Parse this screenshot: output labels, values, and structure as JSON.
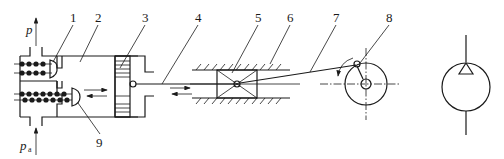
{
  "diagram": {
    "type": "hydraulic-schematic",
    "part_labels": [
      "1",
      "2",
      "3",
      "4",
      "5",
      "6",
      "7",
      "8",
      "9"
    ],
    "pressure_labels": {
      "outlet": "p",
      "inlet": "p",
      "inlet_subscript": "a"
    },
    "components": [
      {
        "id": "1",
        "name": "discharge check valve"
      },
      {
        "id": "2",
        "name": "sealed working chamber"
      },
      {
        "id": "3",
        "name": "plunger"
      },
      {
        "id": "4",
        "name": "piston rod"
      },
      {
        "id": "5",
        "name": "crosshead slider"
      },
      {
        "id": "6",
        "name": "slide guide"
      },
      {
        "id": "7",
        "name": "connecting rod"
      },
      {
        "id": "8",
        "name": "crank"
      },
      {
        "id": "9",
        "name": "suction check valve"
      }
    ],
    "symbol": "fixed-displacement pump (single direction)"
  }
}
